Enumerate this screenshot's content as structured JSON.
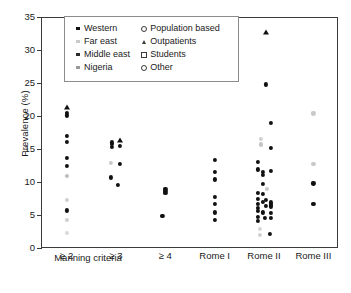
{
  "chart_data": {
    "type": "scatter",
    "title": "",
    "xlabel": "Manning criteria",
    "ylabel": "Prevalence (%)",
    "ylim": [
      0,
      35
    ],
    "yticks": [
      0,
      5,
      10,
      15,
      20,
      25,
      30,
      35
    ],
    "grid": false,
    "legend_position": "top-center-inside",
    "categories": [
      "≥ 2",
      "≥ 3",
      "≥ 4",
      "Rome I",
      "Rome II",
      "Rome III"
    ],
    "group_label": "Manning criteria",
    "group_label_covers": [
      "≥ 2",
      "≥ 3",
      "≥ 4"
    ],
    "legend": [
      {
        "label": "Western",
        "marker": "square",
        "fill": "#111111"
      },
      {
        "label": "Far east",
        "marker": "square",
        "fill": "#c9c9c9"
      },
      {
        "label": "Middle east",
        "marker": "square",
        "fill": "#2b2b2b"
      },
      {
        "label": "Nigeria",
        "marker": "square",
        "fill": "#9a9a9a"
      },
      {
        "label": "Population based",
        "marker": "open-circle",
        "fill": "#ffffff"
      },
      {
        "label": "Outpatients",
        "marker": "filled-triangle",
        "fill": "#111111"
      },
      {
        "label": "Students",
        "marker": "open-square",
        "fill": "#ffffff"
      },
      {
        "label": "Other",
        "marker": "open-circle-small",
        "fill": "#ffffff"
      }
    ],
    "series": [
      {
        "name": "≥ 2",
        "x_index": 0,
        "points": [
          {
            "y": 30.9,
            "shade": "#111111",
            "shape": "dot",
            "dx": 0
          },
          {
            "y": 21.4,
            "shade": "#111111",
            "shape": "tri",
            "dx": 0
          },
          {
            "y": 20.5,
            "shade": "#111111",
            "shape": "dot",
            "dx": 0
          },
          {
            "y": 20.1,
            "shade": "#111111",
            "shape": "dot",
            "dx": 0
          },
          {
            "y": 17.0,
            "shade": "#111111",
            "shape": "dot",
            "dx": 0
          },
          {
            "y": 16.1,
            "shade": "#111111",
            "shape": "dot",
            "dx": 0
          },
          {
            "y": 13.6,
            "shade": "#111111",
            "shape": "dot",
            "dx": 0
          },
          {
            "y": 12.5,
            "shade": "#111111",
            "shape": "dot",
            "dx": 0
          },
          {
            "y": 10.9,
            "shade": "#bdbdbd",
            "shape": "dot",
            "dx": 0
          },
          {
            "y": 7.3,
            "shade": "#cfcfcf",
            "shape": "dot",
            "dx": 0
          },
          {
            "y": 5.7,
            "shade": "#111111",
            "shape": "dot",
            "dx": 0
          },
          {
            "y": 4.2,
            "shade": "#cfcfcf",
            "shape": "dot",
            "dx": 0
          },
          {
            "y": 2.3,
            "shade": "#d8d8d8",
            "shape": "dot",
            "dx": 0
          }
        ]
      },
      {
        "name": "≥ 3",
        "x_index": 1,
        "points": [
          {
            "y": 16.4,
            "shade": "#111111",
            "shape": "tri",
            "dx": 4
          },
          {
            "y": 16.0,
            "shade": "#111111",
            "shape": "dot",
            "dx": -4
          },
          {
            "y": 15.8,
            "shade": "#111111",
            "shape": "dot",
            "dx": -4
          },
          {
            "y": 15.5,
            "shade": "#111111",
            "shape": "dot",
            "dx": 4
          },
          {
            "y": 15.3,
            "shade": "#111111",
            "shape": "dot",
            "dx": -4
          },
          {
            "y": 12.8,
            "shade": "#111111",
            "shape": "dot",
            "dx": 4
          },
          {
            "y": 12.9,
            "shade": "#c9c9c9",
            "shape": "dot",
            "dx": -5
          },
          {
            "y": 10.7,
            "shade": "#111111",
            "shape": "dot",
            "dx": -5
          },
          {
            "y": 9.6,
            "shade": "#111111",
            "shape": "dot",
            "dx": 2
          }
        ]
      },
      {
        "name": "≥ 4",
        "x_index": 2,
        "points": [
          {
            "y": 9.0,
            "shade": "#111111",
            "shape": "dot",
            "dx": 0
          },
          {
            "y": 8.6,
            "shade": "#111111",
            "shape": "dot",
            "dx": 0
          },
          {
            "y": 8.3,
            "shade": "#111111",
            "shape": "dot",
            "dx": 0
          },
          {
            "y": 4.9,
            "shade": "#111111",
            "shape": "dot",
            "dx": -3
          }
        ]
      },
      {
        "name": "Rome I",
        "x_index": 3,
        "points": [
          {
            "y": 13.3,
            "shade": "#111111",
            "shape": "dot",
            "dx": 0
          },
          {
            "y": 11.5,
            "shade": "#111111",
            "shape": "dot",
            "dx": 0
          },
          {
            "y": 10.4,
            "shade": "#111111",
            "shape": "dot",
            "dx": 0
          },
          {
            "y": 7.8,
            "shade": "#111111",
            "shape": "dot",
            "dx": 0
          },
          {
            "y": 6.7,
            "shade": "#111111",
            "shape": "dot",
            "dx": 0
          },
          {
            "y": 5.4,
            "shade": "#111111",
            "shape": "dot",
            "dx": 0
          },
          {
            "y": 4.3,
            "shade": "#111111",
            "shape": "dot",
            "dx": 0
          }
        ]
      },
      {
        "name": "Rome II",
        "x_index": 4,
        "points": [
          {
            "y": 32.8,
            "shade": "#111111",
            "shape": "tri",
            "dx": 2
          },
          {
            "y": 24.8,
            "shade": "#111111",
            "shape": "dot",
            "dx": 2
          },
          {
            "y": 18.9,
            "shade": "#111111",
            "shape": "dot",
            "dx": 7
          },
          {
            "y": 16.5,
            "shade": "#d0d0d0",
            "shape": "dot",
            "dx": -3
          },
          {
            "y": 15.7,
            "shade": "#c4c4c4",
            "shape": "dot",
            "dx": -3
          },
          {
            "y": 15.2,
            "shade": "#111111",
            "shape": "dot",
            "dx": 7
          },
          {
            "y": 13.0,
            "shade": "#111111",
            "shape": "dot",
            "dx": -6
          },
          {
            "y": 11.9,
            "shade": "#111111",
            "shape": "dot",
            "dx": -6
          },
          {
            "y": 11.7,
            "shade": "#111111",
            "shape": "dot",
            "dx": 7
          },
          {
            "y": 11.5,
            "shade": "#111111",
            "shape": "dot",
            "dx": -1
          },
          {
            "y": 11.1,
            "shade": "#111111",
            "shape": "dot",
            "dx": -1
          },
          {
            "y": 9.7,
            "shade": "#111111",
            "shape": "dot",
            "dx": -1
          },
          {
            "y": 8.9,
            "shade": "#c9c9c9",
            "shape": "dot",
            "dx": 3
          },
          {
            "y": 8.4,
            "shade": "#111111",
            "shape": "dot",
            "dx": -6
          },
          {
            "y": 8.2,
            "shade": "#111111",
            "shape": "dot",
            "dx": -1
          },
          {
            "y": 7.4,
            "shade": "#111111",
            "shape": "dot",
            "dx": -6
          },
          {
            "y": 7.3,
            "shade": "#111111",
            "shape": "dot",
            "dx": 2
          },
          {
            "y": 7.0,
            "shade": "#111111",
            "shape": "dot",
            "dx": -1
          },
          {
            "y": 6.9,
            "shade": "#111111",
            "shape": "dot",
            "dx": 7
          },
          {
            "y": 6.7,
            "shade": "#111111",
            "shape": "dot",
            "dx": -6
          },
          {
            "y": 6.6,
            "shade": "#111111",
            "shape": "dot",
            "dx": 7
          },
          {
            "y": 6.4,
            "shade": "#111111",
            "shape": "dot",
            "dx": 2
          },
          {
            "y": 6.3,
            "shade": "#111111",
            "shape": "dot",
            "dx": 7
          },
          {
            "y": 6.1,
            "shade": "#111111",
            "shape": "dot",
            "dx": -6
          },
          {
            "y": 5.6,
            "shade": "#111111",
            "shape": "dot",
            "dx": -6
          },
          {
            "y": 5.4,
            "shade": "#111111",
            "shape": "dot",
            "dx": -1
          },
          {
            "y": 5.3,
            "shade": "#111111",
            "shape": "dot",
            "dx": 7
          },
          {
            "y": 4.7,
            "shade": "#111111",
            "shape": "dot",
            "dx": -6
          },
          {
            "y": 4.6,
            "shade": "#111111",
            "shape": "dot",
            "dx": 7
          },
          {
            "y": 4.5,
            "shade": "#111111",
            "shape": "dot",
            "dx": 1
          },
          {
            "y": 4.1,
            "shade": "#111111",
            "shape": "dot",
            "dx": -6
          },
          {
            "y": 2.9,
            "shade": "#d5d5d5",
            "shape": "dot",
            "dx": -4
          },
          {
            "y": 2.1,
            "shade": "#111111",
            "shape": "dot",
            "dx": 6
          },
          {
            "y": 2.0,
            "shade": "#d0d0d0",
            "shape": "dot",
            "dx": -4
          }
        ]
      },
      {
        "name": "Rome III",
        "x_index": 5,
        "points": [
          {
            "y": 20.4,
            "shade": "#c9c9c9",
            "shape": "dot",
            "dx": 0
          },
          {
            "y": 12.8,
            "shade": "#c9c9c9",
            "shape": "dot",
            "dx": 0
          },
          {
            "y": 9.8,
            "shade": "#111111",
            "shape": "dot",
            "dx": 0
          },
          {
            "y": 6.7,
            "shade": "#111111",
            "shape": "dot",
            "dx": 0
          }
        ]
      }
    ]
  }
}
